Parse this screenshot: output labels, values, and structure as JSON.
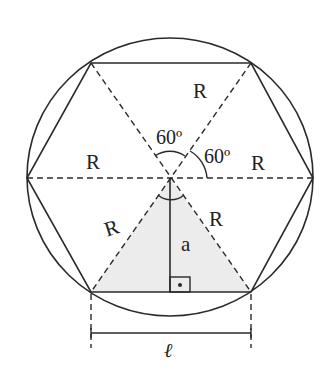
{
  "diagram": {
    "type": "inscribed-regular-hexagon",
    "colors": {
      "stroke": "#2a2a2a",
      "shaded_triangle": "#ececec",
      "background": "#ffffff"
    },
    "labels": {
      "radius_top": "R",
      "radius_left": "R",
      "radius_right": "R",
      "radius_lower_left": "R",
      "radius_lower_right": "R",
      "angle_top": "60º",
      "angle_right": "60º",
      "apothem": "a",
      "side": "ℓ"
    }
  }
}
